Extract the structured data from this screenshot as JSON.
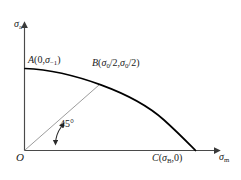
{
  "diagram": {
    "kind": "haigh-fatigue-limit-diagram",
    "axes": {
      "y_label_symbol": "σ",
      "y_label_subscript": "a",
      "x_label_symbol": "σ",
      "x_label_subscript": "m",
      "origin_label": "O"
    },
    "points": [
      {
        "id": "A",
        "name": "A",
        "label": "A(0,σ₁)",
        "label_parts": {
          "point": "A",
          "open": "(",
          "x": "0",
          "sep": ",",
          "y_symbol": "σ",
          "y_subscript": "−1",
          "close": ")"
        },
        "x_value": "0",
        "y_value": "σ₋₁"
      },
      {
        "id": "B",
        "name": "B",
        "label": "B(σ0/2,σ0/2)",
        "label_parts": {
          "point": "B",
          "open": "(",
          "x_symbol": "σ",
          "x_subscript": "0",
          "x_div": "/2",
          "sep": ",",
          "y_symbol": "σ",
          "y_subscript": "0",
          "y_div": "/2",
          "close": ")"
        },
        "x_value": "σ₀/2",
        "y_value": "σ₀/2"
      },
      {
        "id": "C",
        "name": "C",
        "label": "C(σB,0)",
        "label_parts": {
          "point": "C",
          "open": "(",
          "x_symbol": "σ",
          "x_subscript": "B",
          "sep": ",",
          "y": "0",
          "close": ")"
        },
        "x_value": "σ_B",
        "y_value": "0"
      }
    ],
    "annotations": [
      {
        "id": "angle-45",
        "text": "45°",
        "value": 45,
        "unit": "degree",
        "describes": "inclination of line OB from the σm axis"
      }
    ],
    "curve": {
      "description": "limit curve from A on the σa axis through B down to C on the σm axis",
      "start_point": "A",
      "mid_point": "B",
      "end_point": "C"
    },
    "diagonal": {
      "description": "thin straight line from origin O through point B at 45 degrees",
      "from": "O",
      "to": "B"
    },
    "colors": {
      "curve": "#000000",
      "axis": "#4a4a4a",
      "diagonal": "#7a7a7a",
      "text": "#1a1a1a",
      "background": "#ffffff"
    }
  }
}
